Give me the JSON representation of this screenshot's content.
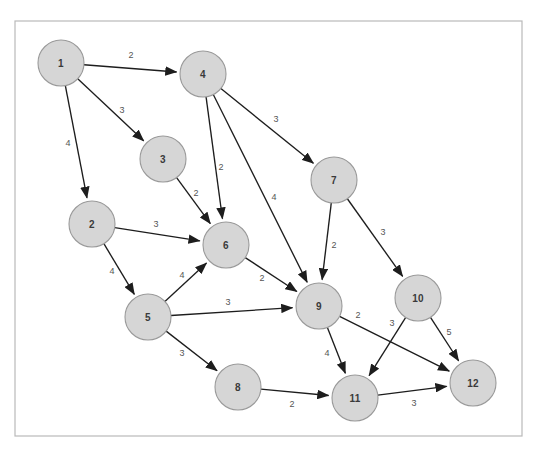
{
  "figure": {
    "kind": "directed-weighted-graph",
    "frame": {
      "x": 15,
      "y": 21,
      "width": 507,
      "height": 415
    },
    "background_color": "#ffffff",
    "frame_border_color": "#b9b9b9",
    "node_fill_color": "#d6d6d6",
    "node_stroke_color": "#9a9a9a",
    "edge_color": "#1d1d1d",
    "weight_label_color": "#555555",
    "node_radius": 23
  },
  "chart_data": {
    "type": "diagram",
    "title": "",
    "subtitle": "",
    "xlabel": "",
    "ylabel": "",
    "graph_type": "directed weighted graph",
    "node_count": 12,
    "edge_count": 21,
    "nodes": [
      {
        "id": "1",
        "label": "1",
        "x": 61,
        "y": 63
      },
      {
        "id": "2",
        "label": "2",
        "x": 92,
        "y": 224
      },
      {
        "id": "3",
        "label": "3",
        "x": 163,
        "y": 159
      },
      {
        "id": "4",
        "label": "4",
        "x": 203,
        "y": 74
      },
      {
        "id": "5",
        "label": "5",
        "x": 148,
        "y": 317
      },
      {
        "id": "6",
        "label": "6",
        "x": 226,
        "y": 245
      },
      {
        "id": "7",
        "label": "7",
        "x": 334,
        "y": 180
      },
      {
        "id": "8",
        "label": "8",
        "x": 238,
        "y": 387
      },
      {
        "id": "9",
        "label": "9",
        "x": 319,
        "y": 306
      },
      {
        "id": "10",
        "label": "10",
        "x": 418,
        "y": 298
      },
      {
        "id": "11",
        "label": "11",
        "x": 355,
        "y": 398
      },
      {
        "id": "12",
        "label": "12",
        "x": 473,
        "y": 383
      }
    ],
    "edges": [
      {
        "from": "1",
        "to": "4",
        "weight": 2,
        "label_x": 131,
        "label_y": 55
      },
      {
        "from": "1",
        "to": "3",
        "weight": 3,
        "label_x": 122,
        "label_y": 110
      },
      {
        "from": "1",
        "to": "2",
        "weight": 4,
        "label_x": 68,
        "label_y": 143
      },
      {
        "from": "4",
        "to": "6",
        "weight": 2,
        "label_x": 221,
        "label_y": 167
      },
      {
        "from": "4",
        "to": "9",
        "weight": 4,
        "label_x": 274,
        "label_y": 197
      },
      {
        "from": "4",
        "to": "7",
        "weight": 3,
        "label_x": 276,
        "label_y": 119
      },
      {
        "from": "3",
        "to": "6",
        "weight": 2,
        "label_x": 196,
        "label_y": 193
      },
      {
        "from": "2",
        "to": "6",
        "weight": 3,
        "label_x": 156,
        "label_y": 224
      },
      {
        "from": "2",
        "to": "5",
        "weight": 4,
        "label_x": 112,
        "label_y": 271
      },
      {
        "from": "5",
        "to": "6",
        "weight": 4,
        "label_x": 182,
        "label_y": 275
      },
      {
        "from": "5",
        "to": "9",
        "weight": 3,
        "label_x": 228,
        "label_y": 302
      },
      {
        "from": "5",
        "to": "8",
        "weight": 3,
        "label_x": 182,
        "label_y": 353
      },
      {
        "from": "6",
        "to": "9",
        "weight": 2,
        "label_x": 262,
        "label_y": 278
      },
      {
        "from": "7",
        "to": "9",
        "weight": 2,
        "label_x": 334,
        "label_y": 245
      },
      {
        "from": "7",
        "to": "10",
        "weight": 3,
        "label_x": 383,
        "label_y": 232
      },
      {
        "from": "9",
        "to": "12",
        "weight": 2,
        "label_x": 358,
        "label_y": 315
      },
      {
        "from": "9",
        "to": "11",
        "weight": 4,
        "label_x": 327,
        "label_y": 353
      },
      {
        "from": "10",
        "to": "11",
        "weight": 3,
        "label_x": 392,
        "label_y": 323
      },
      {
        "from": "10",
        "to": "12",
        "weight": 5,
        "label_x": 449,
        "label_y": 332
      },
      {
        "from": "8",
        "to": "11",
        "weight": 2,
        "label_x": 292,
        "label_y": 404
      },
      {
        "from": "11",
        "to": "12",
        "weight": 3,
        "label_x": 414,
        "label_y": 403
      }
    ]
  }
}
